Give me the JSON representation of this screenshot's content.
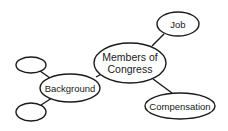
{
  "diagram": {
    "type": "concept-map",
    "center": {
      "label_line1": "Members of",
      "label_line2": "Congress"
    },
    "nodes": {
      "job": {
        "label": "Job"
      },
      "background": {
        "label": "Background"
      },
      "compensation": {
        "label": "Compensation"
      },
      "blank_top": {
        "label": ""
      },
      "blank_bottom": {
        "label": ""
      }
    },
    "edges": [
      [
        "Members of Congress",
        "Job"
      ],
      [
        "Members of Congress",
        "Background"
      ],
      [
        "Members of Congress",
        "Compensation"
      ],
      [
        "Background",
        "blank_top"
      ],
      [
        "Background",
        "blank_bottom"
      ]
    ]
  }
}
